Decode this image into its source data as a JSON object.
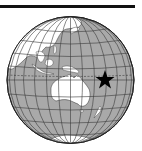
{
  "map": {
    "type": "orthographic-globe-locator",
    "region_shown": "Asia-Pacific / Oceania",
    "marker": {
      "symbol": "star",
      "color": "#000000",
      "x": 105,
      "y": 80,
      "label": "location marker"
    },
    "colors": {
      "ocean": "#a9a9a9",
      "land": "#ffffff",
      "graticule": "#3a3a3a",
      "outline": "#222222",
      "topbar": "#111111"
    },
    "landmasses": [
      "Asia",
      "Maritime Southeast Asia",
      "Australia",
      "New Guinea",
      "New Zealand",
      "Antarctica"
    ]
  }
}
